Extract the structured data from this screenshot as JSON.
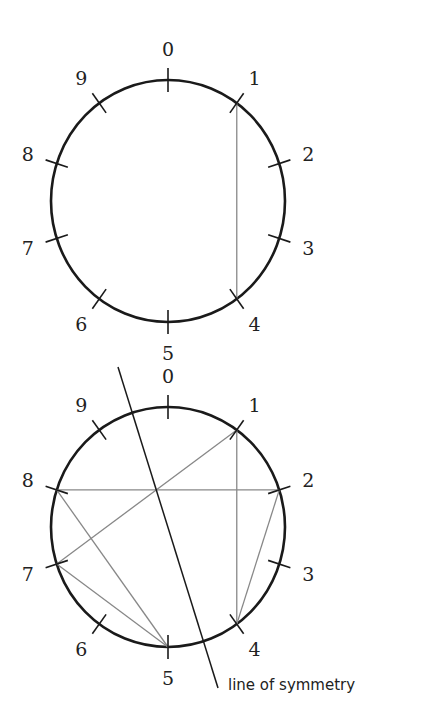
{
  "diagrams": [
    {
      "name": "top-circle",
      "center": [
        168,
        201
      ],
      "radius": [
        117,
        121
      ],
      "labels": [
        "0",
        "1",
        "2",
        "3",
        "4",
        "5",
        "6",
        "7",
        "8",
        "9"
      ],
      "chords": [
        [
          1,
          4
        ]
      ]
    },
    {
      "name": "bottom-circle",
      "center": [
        168,
        527
      ],
      "radius": [
        117,
        120
      ],
      "labels": [
        "0",
        "1",
        "2",
        "3",
        "4",
        "5",
        "6",
        "7",
        "8",
        "9"
      ],
      "chords": [
        [
          1,
          4
        ],
        [
          4,
          2
        ],
        [
          2,
          8
        ],
        [
          8,
          5
        ],
        [
          5,
          7
        ],
        [
          7,
          1
        ]
      ],
      "symmetry_line": {
        "from": [
          118,
          367
        ],
        "to": [
          218,
          688
        ]
      },
      "symmetry_caption": "line of symmetry"
    }
  ],
  "colors": {
    "circle": "#1a1a1a",
    "chord": "#888888"
  }
}
